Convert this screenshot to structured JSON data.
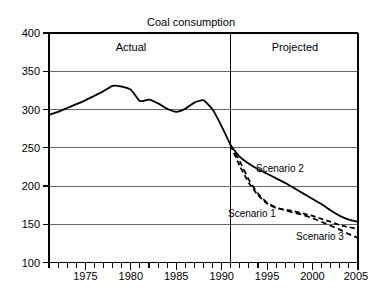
{
  "chart_data": {
    "type": "line",
    "title": "Coal consumption",
    "xlabel": "",
    "ylabel": "",
    "xlim": [
      1971,
      2005
    ],
    "ylim": [
      100,
      400
    ],
    "grid": true,
    "legend_position": "inline-annotations",
    "x_ticks_major": [
      1975,
      1980,
      1985,
      1990,
      1995,
      2000,
      2005
    ],
    "x_ticks_minor_step": 1,
    "y_ticks": [
      100,
      150,
      200,
      250,
      300,
      350,
      400
    ],
    "annotations": [
      {
        "text": "Actual",
        "x": 1980,
        "y": 385
      },
      {
        "text": "Projected",
        "x": 1998,
        "y": 385
      },
      {
        "text": "Scenario 2",
        "x": 1996.5,
        "y": 216
      },
      {
        "text": "Scenario 1",
        "x": 1994.2,
        "y": 158
      },
      {
        "text": "Scenario 3",
        "x": 2001.5,
        "y": 127
      }
    ],
    "divider": {
      "x": 1991,
      "label_left": "Actual",
      "label_right": "Projected"
    },
    "series": [
      {
        "name": "Actual",
        "style": "solid",
        "x": [
          1971,
          1972,
          1973,
          1974,
          1975,
          1976,
          1977,
          1978,
          1979,
          1980,
          1981,
          1982,
          1983,
          1984,
          1985,
          1986,
          1987,
          1988,
          1989,
          1990,
          1991
        ],
        "values": [
          293,
          297,
          302,
          307,
          312,
          318,
          324,
          331,
          330,
          326,
          311,
          313,
          308,
          301,
          297,
          301,
          309,
          312,
          300,
          278,
          253
        ]
      },
      {
        "name": "Scenario 2",
        "style": "solid",
        "x": [
          1991,
          1992,
          1993,
          1994,
          1995,
          1996,
          1997,
          1998,
          1999,
          2000,
          2001,
          2002,
          2003,
          2004,
          2005
        ],
        "values": [
          253,
          238,
          229,
          222,
          216,
          210,
          204,
          197,
          190,
          183,
          176,
          168,
          161,
          156,
          153
        ]
      },
      {
        "name": "Scenario 1",
        "style": "dashed",
        "x": [
          1991,
          1992,
          1993,
          1994,
          1995,
          1996,
          1997,
          1998,
          1999,
          2000,
          2001,
          2002,
          2003,
          2004,
          2005
        ],
        "values": [
          253,
          226,
          204,
          188,
          177,
          171,
          169,
          167,
          164,
          161,
          157,
          153,
          149,
          146,
          144
        ]
      },
      {
        "name": "Scenario 3",
        "style": "dashed",
        "x": [
          1991,
          1992,
          1993,
          1994,
          1995,
          1996,
          1997,
          1998,
          1999,
          2000,
          2001,
          2002,
          2003,
          2004,
          2005
        ],
        "values": [
          253,
          232,
          208,
          190,
          178,
          172,
          168,
          165,
          162,
          158,
          153,
          148,
          143,
          137,
          132
        ]
      }
    ]
  },
  "labels": {
    "title": "Coal consumption",
    "actual": "Actual",
    "projected": "Projected",
    "scenario1": "Scenario 1",
    "scenario2": "Scenario 2",
    "scenario3": "Scenario 3",
    "y": {
      "t400": "400",
      "t350": "350",
      "t300": "300",
      "t250": "250",
      "t200": "200",
      "t150": "150",
      "t100": "100"
    },
    "x": {
      "t1975": "1975",
      "t1980": "1980",
      "t1985": "1985",
      "t1990": "1990",
      "t1995": "1995",
      "t2000": "2000",
      "t2005": "2005"
    }
  },
  "colors": {
    "ink": "#000000",
    "grid": "#555555",
    "background": "#ffffff"
  }
}
